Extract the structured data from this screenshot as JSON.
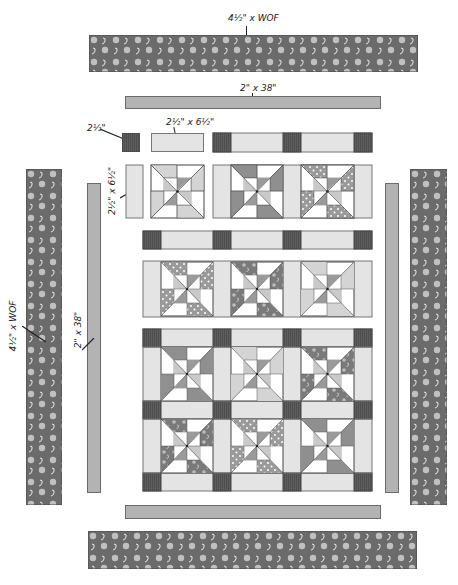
{
  "diagram": {
    "colors": {
      "print_dark": "#6b6b6b",
      "inner_border": "#b3b3b3",
      "sashing": "#e4e4e4",
      "cornerstone": "#5e5e5e",
      "block_light": "#ffffff",
      "block_medium": "#c9c9c9",
      "block_dark": "#8f8f8f",
      "outline": "#555555"
    },
    "labels": {
      "outer_border_top": "4½\" x WOF",
      "inner_border_top": "2\" x 38\"",
      "cornerstone": "2½\"",
      "sashing_horizontal": "2½\" x 6½\"",
      "sashing_vertical": "2½\" x 6½\"",
      "outer_border_left": "4½\" x WOF",
      "inner_border_left": "2\" x 38\""
    },
    "layout": {
      "block_rows": 4,
      "block_columns": 3,
      "total_blocks": 12,
      "sashing_rows": 5,
      "cornerstones_per_sashing_row": 4
    },
    "blocks": [
      {
        "row": 1,
        "col": 1,
        "fabric": "medium-gray",
        "separated": true
      },
      {
        "row": 1,
        "col": 2,
        "fabric": "dark-gray"
      },
      {
        "row": 1,
        "col": 3,
        "fabric": "polka-dot"
      },
      {
        "row": 2,
        "col": 1,
        "fabric": "polka-dot"
      },
      {
        "row": 2,
        "col": 2,
        "fabric": "swirl-print"
      },
      {
        "row": 2,
        "col": 3,
        "fabric": "medium-gray"
      },
      {
        "row": 3,
        "col": 1,
        "fabric": "dark-gray"
      },
      {
        "row": 3,
        "col": 2,
        "fabric": "medium-gray"
      },
      {
        "row": 3,
        "col": 3,
        "fabric": "swirl-print"
      },
      {
        "row": 4,
        "col": 1,
        "fabric": "swirl-print"
      },
      {
        "row": 4,
        "col": 2,
        "fabric": "polka-dot"
      },
      {
        "row": 4,
        "col": 3,
        "fabric": "dark-gray"
      }
    ]
  }
}
